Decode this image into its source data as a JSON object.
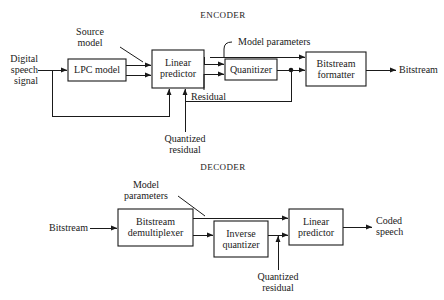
{
  "figure": {
    "encoder_title": "ENCODER",
    "decoder_title": "DECODER"
  },
  "encoder": {
    "blocks": [
      {
        "id": "lpc-model",
        "label_line1": "LPC model",
        "label_line2": ""
      },
      {
        "id": "linear-predictor",
        "label_line1": "Linear",
        "label_line2": "predictor"
      },
      {
        "id": "quantizer",
        "label_line1": "Quanitizer",
        "label_line2": ""
      },
      {
        "id": "bitstream-formatter",
        "label_line1": "Bitstream",
        "label_line2": "formatter"
      }
    ],
    "input_label": {
      "line1": "Digital",
      "line2": "speech",
      "line3": "signal"
    },
    "output_label": "Bitstream",
    "annotations": {
      "source_model_line1": "Source",
      "source_model_line2": "model",
      "model_parameters": "Model parameters",
      "residual": "Residual",
      "quantized_residual_line1": "Quantized",
      "quantized_residual_line2": "residual"
    }
  },
  "decoder": {
    "blocks": [
      {
        "id": "bitstream-demultiplexer",
        "label_line1": "Bitstream",
        "label_line2": "demultiplexer"
      },
      {
        "id": "inverse-quantizer",
        "label_line1": "Inverse",
        "label_line2": "quantizer"
      },
      {
        "id": "linear-predictor",
        "label_line1": "Linear",
        "label_line2": "predictor"
      }
    ],
    "input_label": "Bitstream",
    "output_label": {
      "line1": "Coded",
      "line2": "speech"
    },
    "annotations": {
      "model_parameters_line1": "Model",
      "model_parameters_line2": "parameters",
      "quantized_residual_line1": "Quantized",
      "quantized_residual_line2": "residual"
    }
  },
  "style": {
    "ink": "#1a1a1a",
    "paper": "#ffffff"
  }
}
